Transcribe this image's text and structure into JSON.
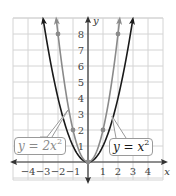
{
  "chart_data": {
    "type": "line",
    "title": "",
    "xlabel": "x",
    "ylabel": "y",
    "xlim": [
      -5,
      5
    ],
    "ylim": [
      -1,
      9
    ],
    "grid": true,
    "x_ticks": [
      "-4",
      "-3",
      "-2",
      "-1",
      "1",
      "2",
      "3",
      "4"
    ],
    "y_ticks": [
      "1",
      "2",
      "3",
      "4",
      "5",
      "6",
      "7",
      "8"
    ],
    "series": [
      {
        "name": "y = x^2",
        "label_main": "y = x",
        "label_exp": "2",
        "color": "#1a1a1a",
        "function": "x^2",
        "x": [
          -3,
          -2,
          -1,
          0,
          1,
          2,
          3
        ],
        "y": [
          9,
          4,
          1,
          0,
          1,
          4,
          9
        ],
        "points": []
      },
      {
        "name": "y = 2x^2",
        "label_main": "y = 2x",
        "label_exp": "2",
        "color": "#8a8a8a",
        "function": "2x^2",
        "x": [
          -2,
          -1,
          0,
          1,
          2
        ],
        "y": [
          8,
          2,
          0,
          2,
          8
        ],
        "points": [
          [
            -2,
            8
          ],
          [
            -1,
            2
          ],
          [
            0,
            0
          ],
          [
            1,
            2
          ],
          [
            2,
            8
          ]
        ]
      }
    ],
    "legend": "callout boxes"
  },
  "labels": {
    "x_axis": "x",
    "y_axis": "y"
  }
}
